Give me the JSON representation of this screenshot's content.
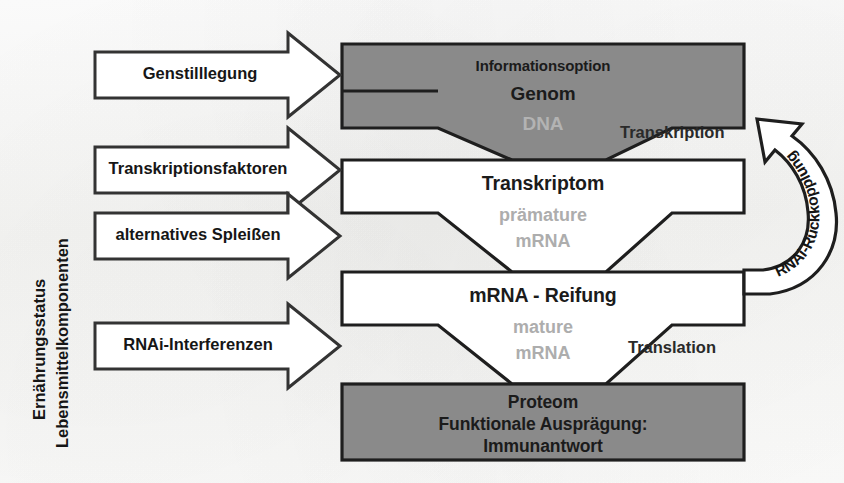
{
  "diagram": {
    "left_axis": {
      "line1": "Ernährungsstatus",
      "line2": "Lebensmittelkomponenten"
    },
    "input_arrows": [
      {
        "label": "Genstilllegung"
      },
      {
        "label": "Transkriptionsfaktoren"
      },
      {
        "label": "alternatives Spleißen"
      },
      {
        "label": "RNAi-Interferenzen"
      }
    ],
    "levels": [
      {
        "name": "genome",
        "caption": "Informationsoption",
        "title": "Genom",
        "molecule": "DNA",
        "fill": "#8a8a8a",
        "text_color": "#141414",
        "molecule_color": "#b3b3b3"
      },
      {
        "name": "transcriptome",
        "caption": "",
        "title": "Transkriptom",
        "molecule_line1": "prämature",
        "molecule_line2": "mRNA",
        "fill": "#ffffff",
        "text_color": "#141414",
        "molecule_color": "#a8a8a8"
      },
      {
        "name": "mrna-maturation",
        "caption": "",
        "title": "mRNA - Reifung",
        "molecule_line1": "mature",
        "molecule_line2": "mRNA",
        "fill": "#ffffff",
        "text_color": "#141414",
        "molecule_color": "#a8a8a8"
      },
      {
        "name": "proteome",
        "title_line1": "Proteom",
        "title_line2": "Funktionale Ausprägung:",
        "title_line3": "Immunantwort",
        "fill": "#8a8a8a",
        "text_color": "#141414"
      }
    ],
    "process_labels": [
      {
        "name": "transcription",
        "label": "Transkription"
      },
      {
        "name": "translation",
        "label": "Translation"
      }
    ],
    "feedback_arrow": {
      "label": "RNAi-Rückkopplung"
    },
    "colors": {
      "stroke": "#1e1e1e",
      "gray_fill": "#8a8a8a",
      "white_fill": "#ffffff",
      "gray_text": "#ababab",
      "background": "#fbfbfa"
    }
  }
}
